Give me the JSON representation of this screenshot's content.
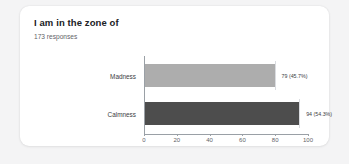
{
  "card": {
    "title": "I am in the zone of",
    "subtitle": "173 responses"
  },
  "chart_data": {
    "type": "bar",
    "orientation": "horizontal",
    "title": "I am in the zone of",
    "subtitle": "173 responses",
    "total_responses": 173,
    "categories": [
      "Madness",
      "Calmness"
    ],
    "values": [
      79,
      94
    ],
    "percentages": [
      "45.7%",
      "54.3%"
    ],
    "data_labels": [
      "79 (45.7%)",
      "94 (54.3%)"
    ],
    "colors": [
      "#adadad",
      "#4d4d4d"
    ],
    "xlabel": "",
    "ylabel": "",
    "xlim": [
      0,
      100
    ],
    "xticks": [
      0,
      20,
      40,
      60,
      80,
      100
    ],
    "xtick_labels": [
      "0",
      "20",
      "40",
      "60",
      "80",
      "100"
    ],
    "grid": false,
    "legend": false
  },
  "theme": {
    "page_background": "#f4f4f5",
    "card_background": "#ffffff",
    "title_color": "#202124",
    "subtitle_color": "#5f6368",
    "axis_color": "#9aa0a6",
    "bar_light": "#adadad",
    "bar_dark": "#4d4d4d"
  }
}
